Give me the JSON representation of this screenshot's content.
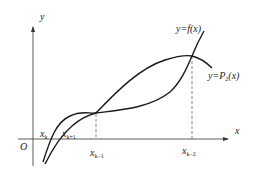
{
  "diagram": {
    "axes": {
      "x_label": "x",
      "y_label": "y",
      "origin_label": "O"
    },
    "curves": [
      {
        "name": "f",
        "label_prefix": "y=",
        "label_func": "f",
        "label_sub": "",
        "label_arg": "(x)"
      },
      {
        "name": "P2",
        "label_prefix": "y=",
        "label_func": "P",
        "label_sub": "2",
        "label_arg": "(x)"
      }
    ],
    "points": [
      {
        "base": "x",
        "sub": "k"
      },
      {
        "base": "x",
        "sub": "k+1"
      },
      {
        "base": "x",
        "sub": "k−1"
      },
      {
        "base": "x",
        "sub": "k−2"
      }
    ],
    "colors": {
      "stroke": "#1a1a1a",
      "axis": "#333333",
      "dash": "#555555",
      "background": "#ffffff"
    }
  }
}
